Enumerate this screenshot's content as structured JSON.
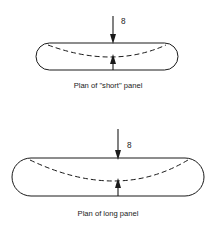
{
  "figure": {
    "background_color": "#ffffff",
    "line_color": "#1a1a1a",
    "diagrams": [
      {
        "id": "short-panel",
        "caption": "Plan of \"short\" panel",
        "load_symbol": "8",
        "deflection_symbol": "8",
        "panel": {
          "x": 36,
          "y": 43,
          "width": 142,
          "height": 27,
          "corner_radius": 13.5
        },
        "load_arrow": {
          "x": 113,
          "y_start": 16,
          "y_end": 44,
          "direction": "down"
        },
        "deflection_arrow": {
          "x": 113,
          "y_start": 70,
          "y_end": 54,
          "direction": "up"
        },
        "dashed_curve": {
          "start_x": 48,
          "start_y": 45,
          "mid_x": 113,
          "mid_y": 57,
          "end_x": 166,
          "end_y": 45
        },
        "caption_position": {
          "x": 108,
          "y": 88
        },
        "symbol_position": {
          "x": 121,
          "y": 24
        }
      },
      {
        "id": "long-panel",
        "caption": "Plan of long panel",
        "load_symbol": "8",
        "deflection_symbol": "8",
        "panel": {
          "x": 12,
          "y": 158,
          "width": 192,
          "height": 38,
          "corner_radius": 19
        },
        "load_arrow": {
          "x": 118,
          "y_start": 129,
          "y_end": 160,
          "direction": "down"
        },
        "deflection_arrow": {
          "x": 118,
          "y_start": 196,
          "y_end": 178,
          "direction": "up"
        },
        "dashed_curve": {
          "start_x": 30,
          "start_y": 160,
          "mid_x": 118,
          "mid_y": 181,
          "end_x": 188,
          "end_y": 160
        },
        "caption_position": {
          "x": 108,
          "y": 216
        },
        "symbol_position": {
          "x": 127,
          "y": 148
        }
      }
    ]
  }
}
